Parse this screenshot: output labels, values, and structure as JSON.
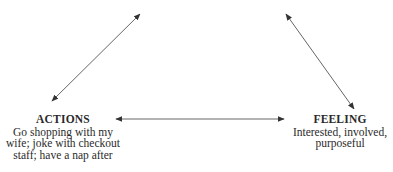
{
  "diagram": {
    "type": "cycle-triangle",
    "arrow_color": "#555555",
    "nodes": {
      "actions": {
        "title": "ACTIONS",
        "lines": [
          "Go shopping with my",
          "wife; joke with checkout",
          "staff; have a nap after"
        ]
      },
      "feeling": {
        "title": "FEELING",
        "lines": [
          "Interested, involved,",
          "purposeful"
        ]
      }
    },
    "edges": [
      {
        "from": "actions",
        "to": "top-left-offscreen",
        "bidirectional": true
      },
      {
        "from": "feeling",
        "to": "top-right-offscreen",
        "bidirectional": true
      },
      {
        "from": "actions",
        "to": "feeling",
        "bidirectional": true
      }
    ]
  }
}
